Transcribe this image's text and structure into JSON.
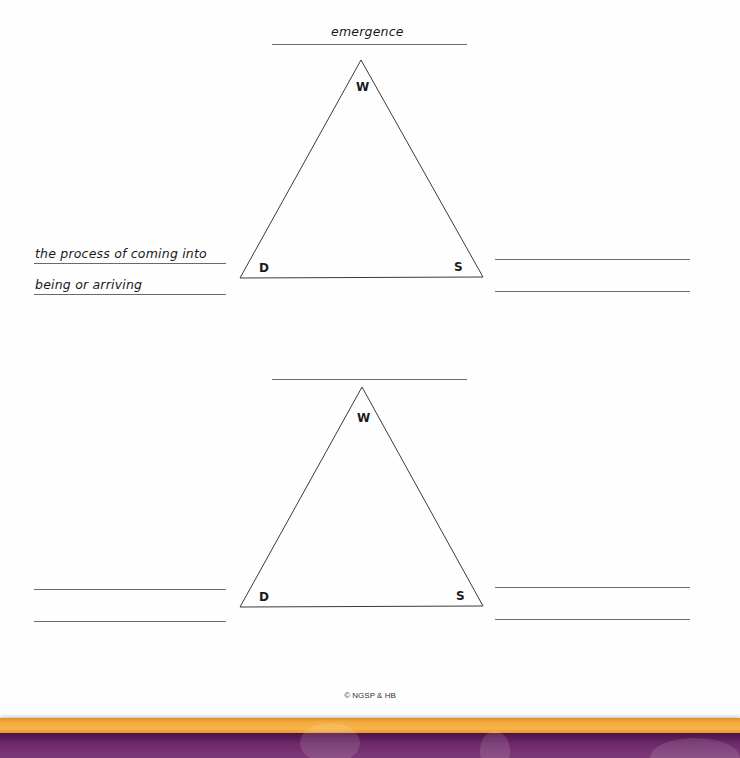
{
  "worksheet": {
    "diagrams": [
      {
        "id": "triangle-1",
        "word": "emergence",
        "vertices": {
          "top": "W",
          "bottom_left": "D",
          "bottom_right": "S"
        },
        "definition_lines": [
          "the process of coming into",
          "being or arriving"
        ],
        "sentence_lines": [
          "",
          ""
        ]
      },
      {
        "id": "triangle-2",
        "word": "",
        "vertices": {
          "top": "W",
          "bottom_left": "D",
          "bottom_right": "S"
        },
        "definition_lines": [
          "",
          ""
        ],
        "sentence_lines": [
          "",
          ""
        ]
      }
    ],
    "footer": {
      "copyright": "© NGSP & HB"
    },
    "colors": {
      "line": "#6a6a6a",
      "orange_band": "#f4a93c",
      "purple_band": "#6e2a6a"
    }
  }
}
